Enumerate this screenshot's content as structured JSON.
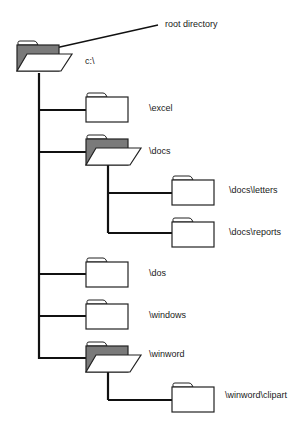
{
  "annotation": {
    "text": "root directory"
  },
  "colors": {
    "line": "#111111",
    "folder_fill": "#ffffff",
    "folder_shade": "#7a7a7a",
    "stroke": "#222222"
  },
  "tree": {
    "root": {
      "label": "c:\\",
      "icon": "open-folder-icon"
    },
    "nodes": [
      {
        "label": "\\excel",
        "icon": "closed-folder-icon",
        "level": 1
      },
      {
        "label": "\\docs",
        "icon": "open-folder-icon",
        "level": 1
      },
      {
        "label": "\\docs\\letters",
        "icon": "closed-folder-icon",
        "level": 2
      },
      {
        "label": "\\docs\\reports",
        "icon": "closed-folder-icon",
        "level": 2
      },
      {
        "label": "\\dos",
        "icon": "closed-folder-icon",
        "level": 1
      },
      {
        "label": "\\windows",
        "icon": "closed-folder-icon",
        "level": 1
      },
      {
        "label": "\\winword",
        "icon": "open-folder-icon",
        "level": 1
      },
      {
        "label": "\\winword\\clipart",
        "icon": "closed-folder-icon",
        "level": 2
      }
    ]
  }
}
